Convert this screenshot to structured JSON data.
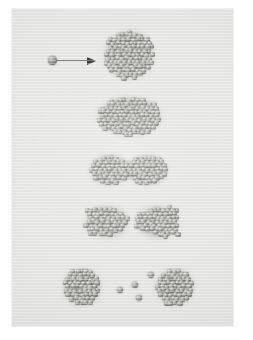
{
  "figure": {
    "caption": "",
    "panel": {
      "background_color": "#e3e3e1",
      "border_color": "#efefee",
      "x": 12,
      "y": 9,
      "width": 221,
      "height": 317
    },
    "sphere_color_light": "#d8d8d4",
    "sphere_color_dark": "#4f4f4d",
    "arrow_color": "#2e2e2c"
  },
  "annotations": {
    "projectile": {
      "label": "incident projectile atom",
      "x": 36,
      "y": 43,
      "sphere_diameter": 9,
      "arrow_length": 48,
      "arrow_direction": "right",
      "meaning": "velocity vector"
    }
  },
  "chart_data": {
    "type": "scatter",
    "subtitle": "Five successive snapshots, top to bottom",
    "xlabel": "",
    "ylabel": "",
    "xlim": [
      0,
      221
    ],
    "ylim": [
      0,
      317
    ],
    "grid": false,
    "legend": null,
    "units": "pixels (panel coordinates)",
    "frames": [
      {
        "index": 1,
        "stage_label": "compact spherical cluster before impact",
        "row_center_y": 46,
        "particle_count": 118,
        "groups": [
          {
            "name": "parent-cluster",
            "shape": "circle",
            "cx": 117,
            "cy": 46,
            "rx": 24,
            "ry": 24,
            "count": 118
          }
        ],
        "free_particles": []
      },
      {
        "index": 2,
        "stage_label": "oblate deformed cluster after energy deposition",
        "row_center_y": 107,
        "particle_count": 124,
        "groups": [
          {
            "name": "deformed-cluster",
            "shape": "ellipse",
            "cx": 117,
            "cy": 107,
            "rx": 32,
            "ry": 19,
            "count": 124
          }
        ],
        "free_particles": []
      },
      {
        "index": 3,
        "stage_label": "necked dumbbell configuration",
        "row_center_y": 161,
        "particle_count": 120,
        "groups": [
          {
            "name": "left-lobe",
            "shape": "ellipse",
            "cx": 98,
            "cy": 161,
            "rx": 19,
            "ry": 14,
            "count": 52
          },
          {
            "name": "neck",
            "shape": "ellipse",
            "cx": 117,
            "cy": 161,
            "rx": 9,
            "ry": 7,
            "count": 16
          },
          {
            "name": "right-lobe",
            "shape": "ellipse",
            "cx": 136,
            "cy": 161,
            "rx": 19,
            "ry": 14,
            "count": 52
          }
        ],
        "free_particles": []
      },
      {
        "index": 4,
        "stage_label": "scission point: two nascent fragments touching",
        "row_center_y": 213,
        "particle_count": 108,
        "groups": [
          {
            "name": "fragment-left",
            "shape": "teardrop-right",
            "cx": 95,
            "cy": 213,
            "rx": 21,
            "ry": 15,
            "count": 54
          },
          {
            "name": "fragment-right",
            "shape": "teardrop-left",
            "cx": 145,
            "cy": 213,
            "rx": 21,
            "ry": 15,
            "count": 54
          }
        ],
        "free_particles": []
      },
      {
        "index": 5,
        "stage_label": "separated daughter fragments with evaporated monomers",
        "row_center_y": 278,
        "particle_count": 96,
        "groups": [
          {
            "name": "daughter-left",
            "shape": "circle",
            "cx": 70,
            "cy": 278,
            "rx": 18,
            "ry": 18,
            "count": 46
          },
          {
            "name": "daughter-right",
            "shape": "circle",
            "cx": 163,
            "cy": 278,
            "rx": 18,
            "ry": 18,
            "count": 46
          }
        ],
        "free_particles": [
          {
            "cx": 108,
            "cy": 281,
            "d": 6
          },
          {
            "cx": 123,
            "cy": 276,
            "d": 6
          },
          {
            "cx": 127,
            "cy": 289,
            "d": 6
          },
          {
            "cx": 139,
            "cy": 266,
            "d": 6
          }
        ]
      }
    ]
  }
}
